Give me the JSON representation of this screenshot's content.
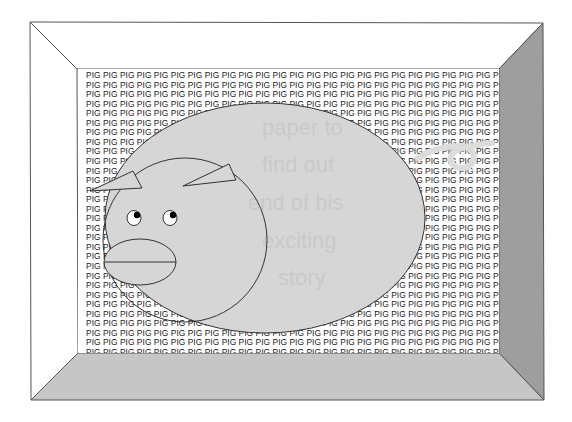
{
  "scene": {
    "description": "Pig in a box illustration",
    "wall_word": "PIG",
    "words_per_row": 25,
    "row_count": 30,
    "ghost_text_lines": [
      "paper to",
      "find out",
      "end of his",
      "exciting",
      "story"
    ]
  },
  "colors": {
    "background": "#ffffff",
    "frame_top": "#ffffff",
    "frame_left": "#ffffff",
    "frame_right": "#9e9e9e",
    "frame_bottom": "#c6c6c6",
    "frame_stroke": "#555555",
    "pig_fill": "#d6d6d6",
    "pig_stroke": "#333333",
    "tail_color": "#dcdcdc",
    "text_color": "#1a1a1a"
  }
}
